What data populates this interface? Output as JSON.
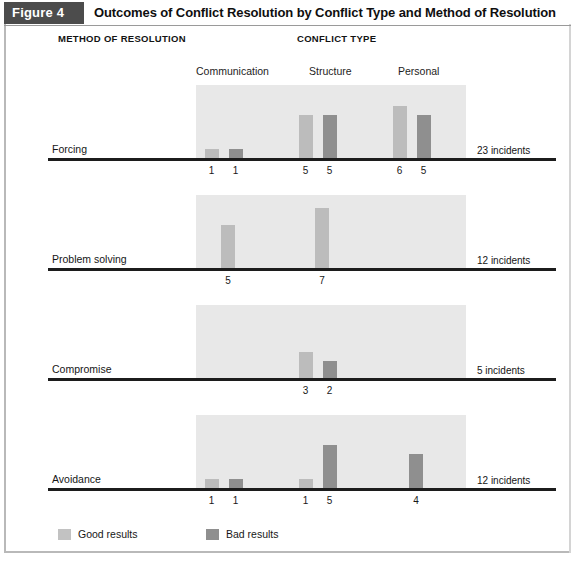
{
  "figure": {
    "number_label": "Figure 4",
    "title": "Outcomes of Conflict Resolution by Conflict Type and Method of Resolution",
    "header_left": "METHOD OF RESOLUTION",
    "header_right": "CONFLICT TYPE"
  },
  "legend": {
    "good": {
      "label": "Good results",
      "color": "#c2c2c2",
      "swatch": "legend-swatch-good"
    },
    "bad": {
      "label": "Bad results",
      "color": "#8f8f8f",
      "swatch": "legend-swatch-bad"
    }
  },
  "columns": [
    {
      "label": "Communication"
    },
    {
      "label": "Structure"
    },
    {
      "label": "Personal"
    }
  ],
  "rows": [
    {
      "label": "Forcing",
      "incidents": "23 incidents"
    },
    {
      "label": "Problem solving",
      "incidents": "12 incidents"
    },
    {
      "label": "Compromise",
      "incidents": "5 incidents"
    },
    {
      "label": "Avoidance",
      "incidents": "12 incidents"
    }
  ],
  "chart_data": {
    "type": "bar",
    "title": "Outcomes of Conflict Resolution by Conflict Type and Method of Resolution",
    "xlabel": "CONFLICT TYPE",
    "ylabel": "METHOD OF RESOLUTION",
    "grid": false,
    "legend_position": "bottom-left",
    "layout": "small multiples: one horizontal baseline panel per method of resolution",
    "ylim": [
      0,
      8
    ],
    "categories": [
      "Communication",
      "Structure",
      "Personal"
    ],
    "series": [
      {
        "name": "Good results",
        "color": "#c2c2c2"
      },
      {
        "name": "Bad results",
        "color": "#8f8f8f"
      }
    ],
    "panels": [
      {
        "name": "Forcing",
        "total_label": "23 incidents",
        "total": 23,
        "values": {
          "Communication": {
            "Good results": 1,
            "Bad results": 1
          },
          "Structure": {
            "Good results": 5,
            "Bad results": 5
          },
          "Personal": {
            "Good results": 6,
            "Bad results": 5
          }
        }
      },
      {
        "name": "Problem solving",
        "total_label": "12 incidents",
        "total": 12,
        "values": {
          "Communication": {
            "Good results": 5,
            "Bad results": null
          },
          "Structure": {
            "Good results": 7,
            "Bad results": null
          },
          "Personal": {
            "Good results": null,
            "Bad results": null
          }
        }
      },
      {
        "name": "Compromise",
        "total_label": "5 incidents",
        "total": 5,
        "values": {
          "Communication": {
            "Good results": null,
            "Bad results": null
          },
          "Structure": {
            "Good results": 3,
            "Bad results": 2
          },
          "Personal": {
            "Good results": null,
            "Bad results": null
          }
        }
      },
      {
        "name": "Avoidance",
        "total_label": "12 incidents",
        "total": 12,
        "values": {
          "Communication": {
            "Good results": 1,
            "Bad results": 1
          },
          "Structure": {
            "Good results": 1,
            "Bad results": 5
          },
          "Personal": {
            "Good results": null,
            "Bad results": 4
          }
        }
      }
    ]
  },
  "geometry": {
    "panel_tops": [
      85,
      195,
      305,
      415
    ],
    "baseline_offsets": [
      73,
      73,
      73,
      73
    ],
    "plot_left": 196,
    "plot_right": 466,
    "panel_bg_top_offset": 2,
    "unit_px": 8.6,
    "bar_width": 14,
    "group_centers": [
      228,
      322,
      416
    ],
    "pair_gap": 19
  }
}
